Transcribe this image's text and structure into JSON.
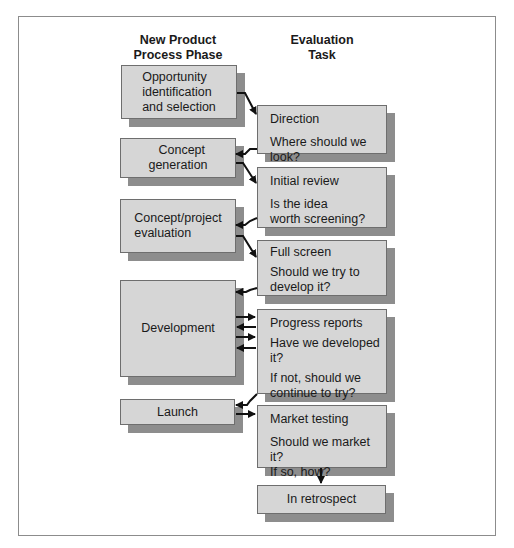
{
  "headers": {
    "phase": [
      "New Product",
      "Process Phase"
    ],
    "task": [
      "Evaluation",
      "Task"
    ]
  },
  "phases": [
    {
      "id": "opportunity",
      "lines": [
        "Opportunity",
        "identification",
        "and selection"
      ]
    },
    {
      "id": "concept-generation",
      "lines": [
        "Concept",
        "generation"
      ]
    },
    {
      "id": "concept-evaluation",
      "lines": [
        "Concept/project",
        "evaluation"
      ]
    },
    {
      "id": "development",
      "lines": [
        "Development"
      ]
    },
    {
      "id": "launch",
      "lines": [
        "Launch"
      ]
    }
  ],
  "tasks": [
    {
      "id": "direction",
      "title": "Direction",
      "question": [
        "Where should we look?"
      ]
    },
    {
      "id": "initial-review",
      "title": "Initial review",
      "question": [
        "Is the idea",
        "worth screening?"
      ]
    },
    {
      "id": "full-screen",
      "title": "Full screen",
      "question": [
        "Should we try to",
        "develop it?"
      ]
    },
    {
      "id": "progress-reports",
      "title": "Progress reports",
      "question": [
        "Have we developed it?"
      ],
      "question2": [
        "If not, should we",
        "continue to try?"
      ]
    },
    {
      "id": "market-testing",
      "title": "Market testing",
      "question": [
        "Should we market it?",
        "If so, how?"
      ]
    },
    {
      "id": "in-retrospect",
      "title": "In retrospect"
    }
  ],
  "colors": {
    "box_fill": "#d6d6d6",
    "box_border": "#6e6e6e",
    "shadow": "#8d8d8d",
    "arrow": "#111111",
    "frame": "#8c8c8c"
  }
}
